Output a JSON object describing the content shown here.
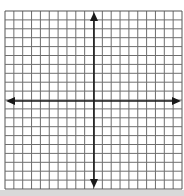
{
  "diagram": {
    "type": "coordinate-plane",
    "grid": {
      "columns": 20,
      "rows": 20,
      "left": 5,
      "top": 11,
      "right": 182,
      "bottom": 189,
      "line_color": "#6e6e6e",
      "border_color": "#555555"
    },
    "axes": {
      "x_axis_y": 101,
      "y_axis_x": 94,
      "color": "#1a1a1a",
      "arrows": [
        "left",
        "right",
        "up",
        "down"
      ]
    },
    "labels": []
  }
}
